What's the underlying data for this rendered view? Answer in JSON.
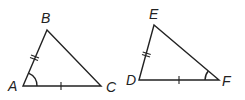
{
  "diagram": {
    "triangles": [
      {
        "name": "ABC",
        "vertices": {
          "A": {
            "label": "A",
            "x": 23,
            "y": 86
          },
          "B": {
            "label": "B",
            "x": 47,
            "y": 30
          },
          "C": {
            "label": "C",
            "x": 101,
            "y": 86
          }
        },
        "marks": {
          "AB": "double-tick",
          "AC": "single-tick",
          "angle_A": "arc"
        }
      },
      {
        "name": "DEF",
        "vertices": {
          "D": {
            "label": "D",
            "x": 139,
            "y": 80
          },
          "E": {
            "label": "E",
            "x": 154,
            "y": 25
          },
          "F": {
            "label": "F",
            "x": 219,
            "y": 80
          }
        },
        "marks": {
          "DE": "double-tick",
          "DF": "single-tick",
          "angle_F": "arc"
        }
      }
    ],
    "colors": {
      "stroke": "#222222",
      "background": "#ffffff"
    }
  }
}
